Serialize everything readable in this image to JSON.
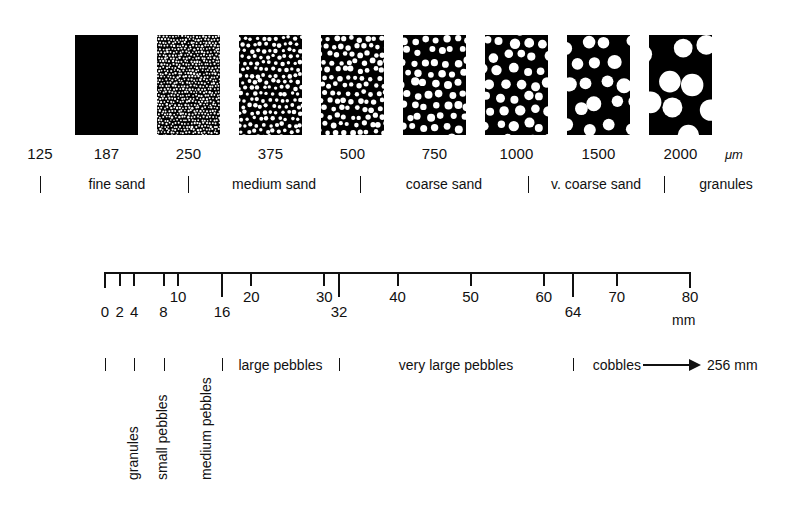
{
  "figure": {
    "ink_color": "#111111",
    "background_color": "#ffffff"
  },
  "sand_panel": {
    "unit": "μm",
    "left_value": "125",
    "swatches": [
      {
        "value": "187",
        "label": "187",
        "density": 1.0,
        "grain_px": 0
      },
      {
        "value": "250",
        "label": "250",
        "density": 0.93,
        "grain_px": 2
      },
      {
        "value": "375",
        "label": "375",
        "density": 0.8,
        "grain_px": 4
      },
      {
        "value": "500",
        "label": "500",
        "density": 0.72,
        "grain_px": 5
      },
      {
        "value": "750",
        "label": "750",
        "density": 0.63,
        "grain_px": 7
      },
      {
        "value": "1000",
        "label": "1000",
        "density": 0.56,
        "grain_px": 9
      },
      {
        "value": "1500",
        "label": "1500",
        "density": 0.47,
        "grain_px": 13
      },
      {
        "value": "2000",
        "label": "2000",
        "density": 0.4,
        "grain_px": 19
      }
    ],
    "classes": [
      {
        "label": "fine sand"
      },
      {
        "label": "medium sand"
      },
      {
        "label": "coarse sand"
      },
      {
        "label": "v. coarse sand"
      },
      {
        "label": "granules"
      }
    ]
  },
  "mm_ruler": {
    "unit": "mm",
    "range": [
      0,
      80
    ],
    "ticks": [
      {
        "value": 0,
        "label": "0",
        "long": false,
        "label_row": 1
      },
      {
        "value": 2,
        "label": "2",
        "long": false,
        "label_row": 1
      },
      {
        "value": 4,
        "label": "4",
        "long": false,
        "label_row": 1
      },
      {
        "value": 8,
        "label": "8",
        "long": false,
        "label_row": 1
      },
      {
        "value": 10,
        "label": "10",
        "long": false,
        "label_row": 0
      },
      {
        "value": 16,
        "label": "16",
        "long": true,
        "label_row": 1
      },
      {
        "value": 20,
        "label": "20",
        "long": false,
        "label_row": 0
      },
      {
        "value": 30,
        "label": "30",
        "long": false,
        "label_row": 0
      },
      {
        "value": 32,
        "label": "32",
        "long": true,
        "label_row": 1
      },
      {
        "value": 40,
        "label": "40",
        "long": false,
        "label_row": 0
      },
      {
        "value": 50,
        "label": "50",
        "long": false,
        "label_row": 0
      },
      {
        "value": 60,
        "label": "60",
        "long": false,
        "label_row": 0
      },
      {
        "value": 64,
        "label": "64",
        "long": true,
        "label_row": 1
      },
      {
        "value": 70,
        "label": "70",
        "long": false,
        "label_row": 0
      },
      {
        "value": 80,
        "label": "80",
        "long": false,
        "label_row": 0
      }
    ]
  },
  "pebble_classes": {
    "separators_mm": [
      0,
      4,
      8,
      16,
      32,
      64
    ],
    "vertical_labels": [
      {
        "label": "granules",
        "mm": 2
      },
      {
        "label": "small pebbles",
        "mm": 6
      },
      {
        "label": "medium pebbles",
        "mm": 12
      }
    ],
    "horizontal_labels": [
      {
        "label": "large pebbles",
        "mm": 24
      },
      {
        "label": "very large pebbles",
        "mm": 48
      },
      {
        "label": "cobbles",
        "mm": 70
      }
    ],
    "arrow_end_label": "256 mm"
  }
}
